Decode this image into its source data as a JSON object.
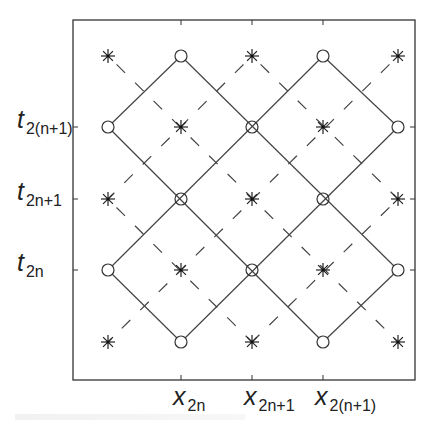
{
  "figure": {
    "frame": {
      "left": 73,
      "top": 20,
      "right": 415,
      "bottom": 380
    },
    "grid_x": [
      108,
      181,
      252,
      323,
      398
    ],
    "grid_y": [
      56,
      127,
      199,
      270,
      342
    ],
    "colors": {
      "line": "#444444",
      "frame": "#333333",
      "text": "#222222"
    },
    "y_labels": [
      {
        "main": "t",
        "sub": "2(n+1)",
        "y": 127
      },
      {
        "main": "t",
        "sub": "2n+1",
        "y": 199
      },
      {
        "main": "t",
        "sub": "2n",
        "y": 270
      }
    ],
    "x_labels": [
      {
        "main": "x",
        "sub": "2n",
        "x": 181
      },
      {
        "main": "x",
        "sub": "2n+1",
        "x": 252
      },
      {
        "main": "x",
        "sub": "2(n+1)",
        "x": 323
      }
    ],
    "markers": {
      "asterisk": [
        [
          0,
          0
        ],
        [
          2,
          0
        ],
        [
          4,
          0
        ],
        [
          1,
          1
        ],
        [
          3,
          1
        ],
        [
          0,
          2
        ],
        [
          2,
          2
        ],
        [
          4,
          2
        ],
        [
          1,
          3
        ],
        [
          3,
          3
        ],
        [
          0,
          4
        ],
        [
          2,
          4
        ],
        [
          4,
          4
        ]
      ],
      "circle": [
        [
          1,
          0
        ],
        [
          3,
          0
        ],
        [
          0,
          1
        ],
        [
          4,
          1
        ],
        [
          0,
          3
        ],
        [
          4,
          3
        ],
        [
          1,
          4
        ],
        [
          3,
          4
        ]
      ],
      "circle_cross": [
        [
          2,
          1
        ],
        [
          1,
          2
        ],
        [
          3,
          2
        ],
        [
          2,
          3
        ]
      ]
    },
    "solid_diamonds": "solid lines connect circle points diagonally forming two stacked rows of diamonds",
    "dashed_lines": "dashed diagonal lines connect asterisk points"
  }
}
